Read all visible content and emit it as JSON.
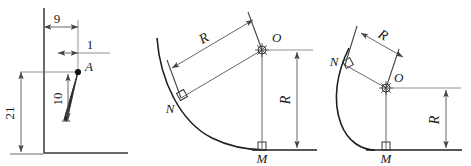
{
  "sheet": {
    "background_color": "#ffffff",
    "line_color": "#1a1a1a",
    "dim_line_color": "#555555",
    "width": 471,
    "height": 166
  },
  "figures": [
    {
      "id": "figure-blade-section",
      "name": "blade-section-dimensions",
      "dimensions": [
        {
          "name": "horizontal-offset",
          "label": "9",
          "orientation": "horizontal"
        },
        {
          "name": "tip-width",
          "label": "1",
          "orientation": "horizontal"
        },
        {
          "name": "blade-height",
          "label": "10",
          "orientation": "vertical"
        },
        {
          "name": "overall-height",
          "label": "21",
          "orientation": "vertical"
        }
      ],
      "points": [
        {
          "name": "point-a",
          "label": "A",
          "style": "filled-dot"
        }
      ]
    },
    {
      "id": "figure-shallow-arc",
      "name": "shallow-arc-radius-construction",
      "dimensions": [
        {
          "name": "radius-no",
          "label": "R",
          "orientation": "angled"
        },
        {
          "name": "radius-om",
          "label": "R",
          "orientation": "vertical"
        }
      ],
      "points": [
        {
          "name": "point-o",
          "label": "O",
          "style": "center-mark"
        },
        {
          "name": "point-n",
          "label": "N",
          "style": "tangent-right-angle"
        },
        {
          "name": "point-m",
          "label": "M",
          "style": "tangent-right-angle"
        }
      ]
    },
    {
      "id": "figure-tight-arc",
      "name": "tight-arc-radius-construction",
      "dimensions": [
        {
          "name": "radius-no",
          "label": "R",
          "orientation": "angled"
        },
        {
          "name": "radius-om",
          "label": "R",
          "orientation": "vertical"
        }
      ],
      "points": [
        {
          "name": "point-o",
          "label": "O",
          "style": "center-mark"
        },
        {
          "name": "point-n",
          "label": "N",
          "style": "tangent-right-angle"
        },
        {
          "name": "point-m",
          "label": "M",
          "style": "tangent-right-angle"
        }
      ]
    }
  ],
  "labels": {
    "fig1": {
      "dim9": "9",
      "dim1": "1",
      "dim10": "10",
      "dim21": "21",
      "ptA": "A"
    },
    "fig2": {
      "radiusTop": "R",
      "radiusRight": "R",
      "ptO": "O",
      "ptN": "N",
      "ptM": "M"
    },
    "fig3": {
      "radiusTop": "R",
      "radiusRight": "R",
      "ptO": "O",
      "ptN": "N",
      "ptM": "M"
    }
  }
}
